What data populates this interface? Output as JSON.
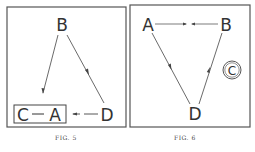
{
  "figures": [
    {
      "id": "fig5",
      "caption": "FIG. 5",
      "nodes": {
        "B": "B",
        "C": "C",
        "A": "A",
        "D": "D"
      },
      "grouped": [
        "C",
        "A"
      ],
      "edges": [
        {
          "from": "B",
          "to": "C-A",
          "style": "solid",
          "arrow": "end"
        },
        {
          "from": "D",
          "to": "B",
          "style": "solid",
          "arrow": "midpoint toward D"
        },
        {
          "from": "D",
          "to": "A",
          "style": "dashed",
          "arrow": "toward A"
        },
        {
          "from": "C",
          "to": "A",
          "style": "solid",
          "arrow": "none"
        }
      ]
    },
    {
      "id": "fig6",
      "caption": "FIG. 6",
      "nodes": {
        "A": "A",
        "B": "B",
        "D": "D",
        "C": "C"
      },
      "circled": [
        "C"
      ],
      "edges": [
        {
          "from": "A",
          "to": "B",
          "style": "solid",
          "arrow": "both meet at midpoint"
        },
        {
          "from": "A",
          "to": "D",
          "style": "solid",
          "arrow": "midpoint toward D"
        },
        {
          "from": "B",
          "to": "D",
          "style": "solid",
          "arrow": "midpoint toward B"
        }
      ]
    }
  ],
  "colors": {
    "ink": "#333333",
    "border": "#555555",
    "background": "#ffffff"
  }
}
